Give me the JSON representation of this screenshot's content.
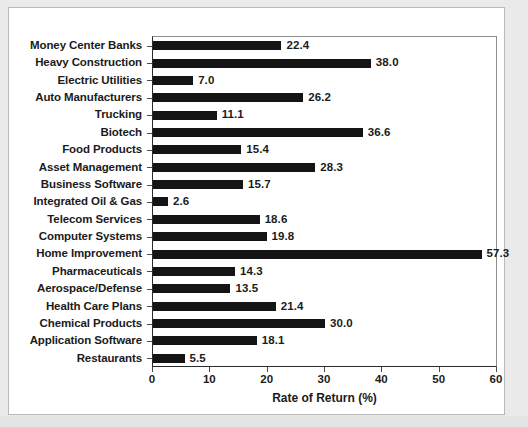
{
  "chart_data": {
    "type": "bar",
    "orientation": "horizontal",
    "title": "",
    "xlabel": "Rate of Return (%)",
    "ylabel": "",
    "xlim": [
      0,
      60
    ],
    "xticks": [
      0,
      10,
      20,
      30,
      40,
      50,
      60
    ],
    "grid": false,
    "legend": null,
    "bar_color": "#141414",
    "categories": [
      "Money Center Banks",
      "Heavy Construction",
      "Electric Utilities",
      "Auto Manufacturers",
      "Trucking",
      "Biotech",
      "Food Products",
      "Asset Management",
      "Business Software",
      "Integrated Oil & Gas",
      "Telecom Services",
      "Computer Systems",
      "Home Improvement",
      "Pharmaceuticals",
      "Aerospace/Defense",
      "Health Care Plans",
      "Chemical Products",
      "Application Software",
      "Restaurants"
    ],
    "values": [
      22.4,
      38.0,
      7.0,
      26.2,
      11.1,
      36.6,
      15.4,
      28.3,
      15.7,
      2.6,
      18.6,
      19.8,
      57.3,
      14.3,
      13.5,
      21.4,
      30.0,
      18.1,
      5.5
    ],
    "value_labels": [
      "22.4",
      "38.0",
      "7.0",
      "26.2",
      "11.1",
      "36.6",
      "15.4",
      "28.3",
      "15.7",
      "2.6",
      "18.6",
      "19.8",
      "57.3",
      "14.3",
      "13.5",
      "21.4",
      "30.0",
      "18.1",
      "5.5"
    ],
    "xtick_labels": [
      "0",
      "10",
      "20",
      "30",
      "40",
      "50",
      "60"
    ]
  }
}
